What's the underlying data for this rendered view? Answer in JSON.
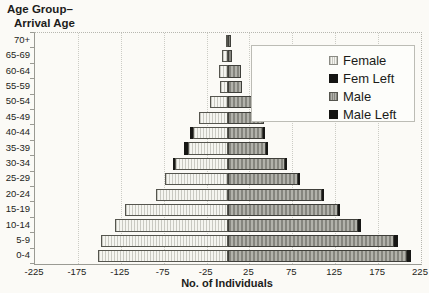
{
  "chart": {
    "y_axis_title_line1": "Age Group–",
    "y_axis_title_line2": "Arrival Age",
    "x_axis_title": "No. of Individuals"
  },
  "colors": {
    "page_background": "#fbfaf6",
    "female_fill": "#f5f5f0",
    "female_hatch": "#c9c9c2",
    "male_fill": "#b2b2ab",
    "male_hatch": "#85857e",
    "left_segment_black": "#171715",
    "axis_line": "#9a9a93",
    "gridline": "#ccccc5",
    "text": "#1d1d1b"
  },
  "chart_data": {
    "type": "bar",
    "orientation": "horizontal-pyramid",
    "xlabel": "No. of Individuals",
    "ylabel": "Age Group–Arrival Age",
    "xlim": [
      -225,
      225
    ],
    "x_ticks": [
      -225,
      -175,
      -125,
      -75,
      -25,
      25,
      75,
      125,
      175,
      225
    ],
    "grid": "vertical-dotted",
    "legend_position": "upper-right-inside",
    "categories_top_to_bottom": [
      "70+",
      "65-69",
      "60-64",
      "55-59",
      "50-54",
      "45-49",
      "40-44",
      "35-39",
      "30-34",
      "25-29",
      "20-24",
      "15-19",
      "10-14",
      "5-9",
      "0-4"
    ],
    "series": [
      {
        "name": "Female",
        "direction": "left",
        "style": "light-hatch",
        "values": [
          2,
          7,
          11,
          9,
          21,
          34,
          41,
          47,
          62,
          73,
          84,
          120,
          132,
          148,
          152
        ]
      },
      {
        "name": "Fem Left",
        "direction": "left",
        "style": "black",
        "values": [
          0,
          0,
          0,
          0,
          0,
          0,
          3,
          4,
          2,
          0,
          0,
          0,
          0,
          0,
          0
        ]
      },
      {
        "name": "Male",
        "direction": "right",
        "style": "dark-hatch",
        "values": [
          3,
          5,
          15,
          16,
          36,
          42,
          41,
          44,
          66,
          81,
          109,
          128,
          151,
          193,
          209
        ]
      },
      {
        "name": "Male Left",
        "direction": "right",
        "style": "black",
        "values": [
          0,
          0,
          0,
          0,
          0,
          0,
          2,
          3,
          3,
          3,
          3,
          3,
          4,
          5,
          4
        ]
      }
    ]
  }
}
